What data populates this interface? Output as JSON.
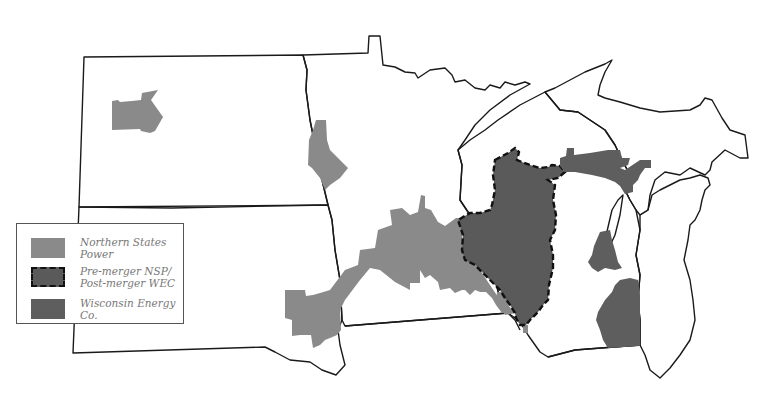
{
  "map": {
    "regions": [
      "North Dakota",
      "South Dakota",
      "Minnesota",
      "Wisconsin",
      "Michigan Upper Peninsula",
      "Michigan Lower Peninsula",
      "Iowa (partial)"
    ],
    "colors": {
      "northern_states_power": "#8a8a8a",
      "wisconsin_energy": "#5a5a5a",
      "outline": "#1a1a1a",
      "background": "#ffffff"
    }
  },
  "legend": {
    "items": [
      {
        "label": "Northern States Power",
        "style": "solid-light-gray",
        "color": "#8a8a8a"
      },
      {
        "label": "Pre-merger NSP/\nPost-merger WEC",
        "style": "dashed-border-dark-gray",
        "color": "#5a5a5a"
      },
      {
        "label": "Wisconsin Energy Co.",
        "style": "solid-dark-gray",
        "color": "#5e5e5e"
      }
    ]
  }
}
